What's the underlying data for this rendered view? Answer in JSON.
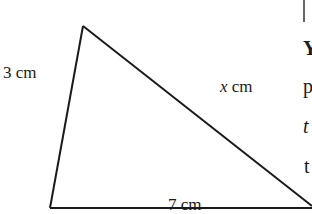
{
  "diagram": {
    "type": "triangle",
    "vertices": {
      "top": [
        82,
        27
      ],
      "bottom_left": [
        50,
        208
      ],
      "bottom_right": [
        312,
        208
      ]
    },
    "sides": {
      "left": {
        "value": "3",
        "unit": "cm",
        "text": "3 cm"
      },
      "hypotenuse": {
        "variable": "x",
        "unit": "cm",
        "text": "x cm"
      },
      "base": {
        "value": "7",
        "unit": "cm",
        "text": "7 cm"
      }
    },
    "stroke_color": "#1a1a1a",
    "background": "#ffffff"
  },
  "labels": {
    "left_side": "3 cm",
    "hyp_var": "x",
    "hyp_unit": " cm",
    "base": "7 cm"
  },
  "cropped_text_fragments": [
    "Y",
    "p",
    "t",
    "t"
  ]
}
